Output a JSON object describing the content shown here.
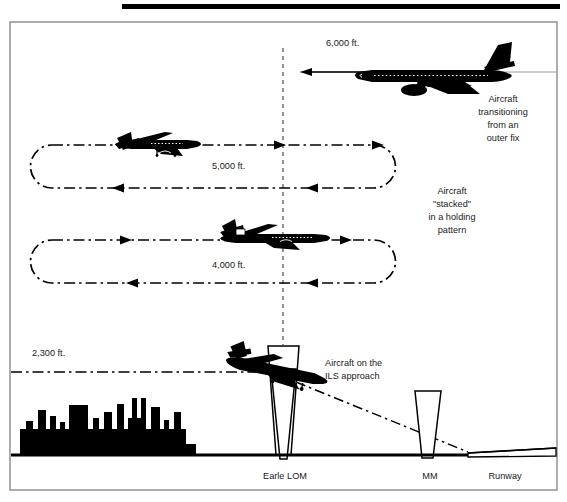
{
  "figure": {
    "title_bar": {
      "name": "top-rule"
    },
    "frame": {
      "border_color": "#888888",
      "background": "#ffffff"
    },
    "altitude_labels": [
      {
        "id": "alt-6000",
        "text": "6,000 ft.",
        "x": 326,
        "y": 46
      },
      {
        "id": "alt-5000",
        "text": "5,000 ft.",
        "x": 212,
        "y": 166
      },
      {
        "id": "alt-4000",
        "text": "4,000 ft.",
        "x": 212,
        "y": 265
      },
      {
        "id": "alt-2300",
        "text": "2,300 ft.",
        "x": 32,
        "y": 353
      }
    ],
    "annotations": [
      {
        "id": "note-transition",
        "x": 503,
        "y": 102,
        "lines": [
          "Aircraft",
          "transitioning",
          "from an",
          "outer fix"
        ]
      },
      {
        "id": "note-stacked",
        "x": 452,
        "y": 194,
        "lines": [
          "Aircraft",
          "\"stacked\"",
          "in a holding",
          "pattern"
        ]
      },
      {
        "id": "note-ils",
        "x": 325,
        "y": 363,
        "lines": [
          "Aircraft on the",
          "ILS approach"
        ]
      }
    ],
    "ground_labels": [
      {
        "id": "label-lom",
        "text": "Earle LOM",
        "x": 285,
        "y": 479
      },
      {
        "id": "label-mm",
        "text": "MM",
        "x": 430,
        "y": 479
      },
      {
        "id": "label-runway",
        "text": "Runway",
        "x": 505,
        "y": 479
      }
    ],
    "aircraft": [
      {
        "id": "aircraft-6000",
        "altitude": "6,000 ft.",
        "heading": "inbound",
        "type": "jet-transport"
      },
      {
        "id": "aircraft-5000",
        "altitude": "5,000 ft.",
        "heading": "outbound",
        "type": "jet-transport"
      },
      {
        "id": "aircraft-4000",
        "altitude": "4,000 ft.",
        "heading": "outbound",
        "type": "jet-transport"
      },
      {
        "id": "aircraft-ils",
        "altitude": "2,300 ft.",
        "heading": "descending",
        "type": "jet-transport"
      }
    ],
    "holding_patterns": [
      {
        "id": "hold-5000",
        "altitude": "5,000 ft.",
        "x": 30,
        "y": 145,
        "w": 366,
        "h": 43
      },
      {
        "id": "hold-4000",
        "altitude": "4,000 ft.",
        "x": 30,
        "y": 240,
        "w": 366,
        "h": 43
      }
    ],
    "markers": [
      {
        "id": "marker-lom",
        "name": "Earle LOM",
        "x": 283,
        "cone": "large"
      },
      {
        "id": "marker-mm",
        "name": "MM",
        "x": 430,
        "cone": "small"
      }
    ],
    "colors": {
      "ink": "#000000",
      "frame": "#8a8a8a",
      "ground": "#000000",
      "text": "#1a1a1a"
    }
  }
}
